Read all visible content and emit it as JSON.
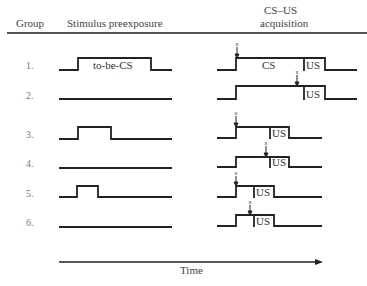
{
  "headers": {
    "group": "Group",
    "preexposure": "Stimulus preexposure",
    "acquisition_line1": "CS–US",
    "acquisition_line2": "acquisition"
  },
  "groups": [
    {
      "label": "1.",
      "preexposure": "long",
      "pre_label": "to-be-CS",
      "cs_label": "CS",
      "us_label": "US",
      "cs_duration": "long",
      "marker": "cs-onset"
    },
    {
      "label": "2.",
      "preexposure": "none",
      "cs_label": "",
      "us_label": "US",
      "cs_duration": "long",
      "marker": "before-us"
    },
    {
      "label": "3.",
      "preexposure": "medium",
      "us_label": "US",
      "cs_duration": "medium",
      "marker": "cs-onset"
    },
    {
      "label": "4.",
      "preexposure": "none",
      "us_label": "US",
      "cs_duration": "medium",
      "marker": "before-us"
    },
    {
      "label": "5.",
      "preexposure": "short",
      "us_label": "US",
      "cs_duration": "short",
      "marker": "cs-onset"
    },
    {
      "label": "6.",
      "preexposure": "none",
      "us_label": "US",
      "cs_duration": "short",
      "marker": "before-us"
    }
  ],
  "axis": {
    "label": "Time"
  },
  "marker_glyph": "x"
}
